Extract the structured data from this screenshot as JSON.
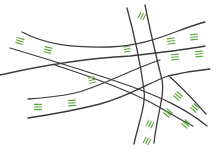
{
  "diagram": {
    "title": "",
    "colors": {
      "background": "#ffffff",
      "road": "#3a3a3a",
      "marking": "#5aa83a"
    },
    "road_width": 1.3,
    "mark_width": 1.1,
    "roads": [
      {
        "id": "road-top-left-upper",
        "d": "M22 32 C 45 44, 70 48, 110 47 C 150 46, 175 30, 205 22"
      },
      {
        "id": "road-top-left-lower",
        "d": "M10 48 C 50 60, 90 72, 130 86 C 160 97, 185 108, 207 126"
      },
      {
        "id": "road-mid-upper",
        "d": "M0 75 C 40 66, 90 58, 130 56 C 165 52, 185 50, 205 46"
      },
      {
        "id": "road-bottom-left-upper",
        "d": "M28 99 C 55 97, 75 94, 85 90 C 110 82, 130 70, 160 60"
      },
      {
        "id": "road-bottom-left-lower",
        "d": "M28 118 C 55 114, 80 109, 100 104 C 130 96, 150 82, 168 76 C 185 72, 200 70, 210 69"
      },
      {
        "id": "road-diag-lower-a",
        "d": "M55 65 C 95 78, 130 92, 150 102 C 165 110, 180 120, 193 126"
      },
      {
        "id": "road-vert-left",
        "d": "M127 8 C 133 30, 140 60, 144 90 C 146 105, 138 125, 134 144"
      },
      {
        "id": "road-vert-right",
        "d": "M145 5 C 150 30, 157 60, 162 80 C 165 95, 157 115, 154 143"
      },
      {
        "id": "road-right-diag",
        "d": "M170 77 C 185 90, 195 102, 206 114"
      }
    ],
    "markings": [
      {
        "id": "mark-tl-1",
        "x": 20,
        "y": 41,
        "angle": 18,
        "count": 3,
        "len": 7
      },
      {
        "id": "mark-tl-2",
        "x": 48,
        "y": 50,
        "angle": 14,
        "count": 3,
        "len": 7
      },
      {
        "id": "mark-top-vert",
        "x": 142,
        "y": 16,
        "angle": -65,
        "count": 3,
        "len": 6
      },
      {
        "id": "mark-mid-1",
        "x": 127,
        "y": 49,
        "angle": -10,
        "count": 3,
        "len": 6
      },
      {
        "id": "mark-right-1",
        "x": 171,
        "y": 41,
        "angle": -8,
        "count": 3,
        "len": 7
      },
      {
        "id": "mark-right-2",
        "x": 194,
        "y": 37,
        "angle": -5,
        "count": 3,
        "len": 7
      },
      {
        "id": "mark-right-3",
        "x": 175,
        "y": 57,
        "angle": -5,
        "count": 3,
        "len": 7
      },
      {
        "id": "mark-right-4",
        "x": 199,
        "y": 54,
        "angle": -5,
        "count": 3,
        "len": 7
      },
      {
        "id": "mark-bl-1",
        "x": 38,
        "y": 107,
        "angle": 0,
        "count": 3,
        "len": 7
      },
      {
        "id": "mark-bl-2",
        "x": 72,
        "y": 103,
        "angle": -4,
        "count": 3,
        "len": 7
      },
      {
        "id": "mark-mid-bottom",
        "x": 92,
        "y": 80,
        "angle": -15,
        "count": 3,
        "len": 6
      },
      {
        "id": "mark-br-1",
        "x": 178,
        "y": 96,
        "angle": 40,
        "count": 3,
        "len": 7
      },
      {
        "id": "mark-br-2",
        "x": 168,
        "y": 113,
        "angle": 40,
        "count": 3,
        "len": 7
      },
      {
        "id": "mark-br-3",
        "x": 195,
        "y": 108,
        "angle": 40,
        "count": 3,
        "len": 7
      },
      {
        "id": "mark-br-4",
        "x": 186,
        "y": 124,
        "angle": 40,
        "count": 3,
        "len": 7
      },
      {
        "id": "mark-vert-low-1",
        "x": 150,
        "y": 124,
        "angle": -65,
        "count": 3,
        "len": 6
      },
      {
        "id": "mark-vert-low-2",
        "x": 147,
        "y": 141,
        "angle": -65,
        "count": 3,
        "len": 6
      }
    ]
  }
}
